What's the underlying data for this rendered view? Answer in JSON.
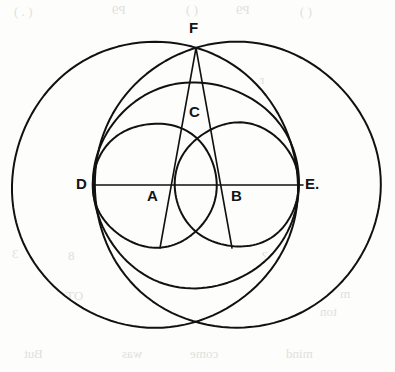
{
  "figure": {
    "background_color": "#fdfdfb",
    "ink_color": "#111111",
    "stroke_width": 2.0,
    "labels": [
      {
        "id": "F",
        "text": "F",
        "x": 196,
        "y": 48,
        "label_x": 189,
        "label_y": 20
      },
      {
        "id": "C",
        "text": "C",
        "x": 196,
        "y": 123,
        "label_x": 189,
        "label_y": 104
      },
      {
        "id": "D",
        "text": "D",
        "x": 96,
        "y": 185,
        "label_x": 76,
        "label_y": 176
      },
      {
        "id": "A",
        "text": "A",
        "x": 155,
        "y": 185,
        "label_x": 147,
        "label_y": 188
      },
      {
        "id": "B",
        "text": "B",
        "x": 237,
        "y": 185,
        "label_x": 231,
        "label_y": 188
      },
      {
        "id": "E",
        "text": "E.",
        "x": 300,
        "y": 185,
        "label_x": 305,
        "label_y": 176
      }
    ],
    "circles": [
      {
        "name": "large-circle-centered-at-A",
        "cx": 155,
        "cy": 185,
        "r": 143
      },
      {
        "name": "large-circle-centered-at-B",
        "cx": 237,
        "cy": 185,
        "r": 143
      },
      {
        "name": "medium-circle-through-D-and-E",
        "cx": 196,
        "cy": 185,
        "r": 103
      },
      {
        "name": "small-circle-centered-at-A",
        "cx": 155,
        "cy": 185,
        "r": 62
      },
      {
        "name": "small-circle-centered-at-B",
        "cx": 237,
        "cy": 185,
        "r": 62
      }
    ],
    "lines": [
      {
        "name": "diameter-line-D-E",
        "x1": 93,
        "y1": 185,
        "x2": 303,
        "y2": 185
      },
      {
        "name": "chord-F-to-A-extended",
        "x1": 196,
        "y1": 48,
        "x2": 160,
        "y2": 248
      },
      {
        "name": "chord-F-to-B-extended",
        "x1": 196,
        "y1": 48,
        "x2": 232,
        "y2": 248
      }
    ],
    "scanned_page_ghost_text": [
      {
        "text": "( . )",
        "x": 14,
        "y": 4
      },
      {
        "text": "P9",
        "x": 112,
        "y": 2
      },
      {
        "text": "(  )",
        "x": 186,
        "y": 2
      },
      {
        "text": "P9",
        "x": 236,
        "y": 2
      },
      {
        "text": "(  )",
        "x": 300,
        "y": 4
      },
      {
        "text": "r",
        "x": 260,
        "y": 72
      },
      {
        "text": "3",
        "x": 12,
        "y": 246
      },
      {
        "text": "8",
        "x": 68,
        "y": 248
      },
      {
        "text": "?",
        "x": 262,
        "y": 248
      },
      {
        "text": "OT",
        "x": 66,
        "y": 288
      },
      {
        "text": "m",
        "x": 340,
        "y": 286
      },
      {
        "text": "ton",
        "x": 320,
        "y": 304
      },
      {
        "text": "But",
        "x": 24,
        "y": 346
      },
      {
        "text": "was",
        "x": 122,
        "y": 346
      },
      {
        "text": "come",
        "x": 190,
        "y": 346
      },
      {
        "text": "mind",
        "x": 286,
        "y": 346
      }
    ]
  }
}
